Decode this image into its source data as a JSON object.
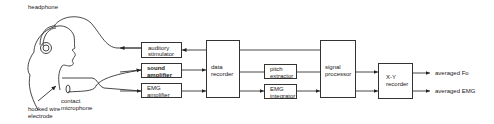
{
  "diagram": {
    "type": "block-diagram",
    "labels": {
      "headphone": "headphone",
      "hooked_wire_electrode": "hooked wire\nelectrode",
      "contact_microphone": "contact\nmicrophone"
    },
    "blocks": {
      "auditory_stimulator": "auditory\nstimulator",
      "sound_amplifier": "sound\namplifier",
      "emg_amplifier": "EMG\namplifier",
      "data_recorder": "data\nrecorder",
      "pitch_extractor": "pitch\nextractor",
      "emg_integrator": "EMG\nintegrator",
      "signal_processor": "signal\nprocessor",
      "xy_recorder": "X-Y\nrecorder"
    },
    "outputs": {
      "averaged_fo": "averaged Fo",
      "averaged_emg": "averaged EMG"
    },
    "connections": [
      [
        "data recorder",
        "auditory stimulator"
      ],
      [
        "auditory stimulator",
        "headphone"
      ],
      [
        "contact microphone",
        "sound amplifier"
      ],
      [
        "hooked wire electrode",
        "EMG amplifier"
      ],
      [
        "sound amplifier",
        "data recorder"
      ],
      [
        "EMG amplifier",
        "data recorder"
      ],
      [
        "auditory stimulator",
        "data recorder"
      ],
      [
        "data recorder",
        "signal processor"
      ],
      [
        "data recorder",
        "pitch extractor"
      ],
      [
        "data recorder",
        "EMG integrator"
      ],
      [
        "pitch extractor",
        "signal processor"
      ],
      [
        "EMG integrator",
        "signal processor"
      ],
      [
        "signal processor",
        "X-Y recorder"
      ],
      [
        "X-Y recorder",
        "averaged Fo"
      ],
      [
        "X-Y recorder",
        "averaged EMG"
      ]
    ]
  }
}
